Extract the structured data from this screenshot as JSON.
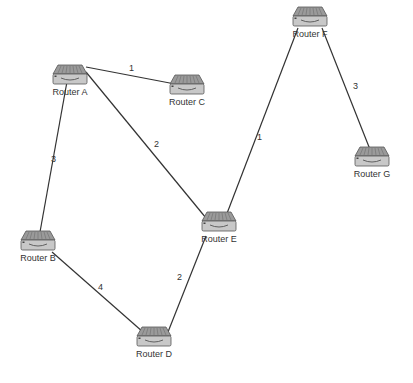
{
  "diagram": {
    "type": "network-topology",
    "colors": {
      "edge": "#333333",
      "label": "#333333",
      "router_body": "#c8c8c8",
      "router_top": "#9a9a9a",
      "router_stroke": "#555555"
    },
    "nodes": [
      {
        "id": "A",
        "label": "Router A",
        "icon": "router-icon",
        "x": 70,
        "y": 78
      },
      {
        "id": "B",
        "label": "Router B",
        "icon": "router-icon",
        "x": 38,
        "y": 244
      },
      {
        "id": "C",
        "label": "Router C",
        "icon": "router-icon",
        "x": 187,
        "y": 88
      },
      {
        "id": "D",
        "label": "Router D",
        "icon": "router-icon",
        "x": 154,
        "y": 340
      },
      {
        "id": "E",
        "label": "Router E",
        "icon": "router-icon",
        "x": 219,
        "y": 225
      },
      {
        "id": "F",
        "label": "Router F",
        "icon": "router-icon",
        "x": 310,
        "y": 20
      },
      {
        "id": "G",
        "label": "Router G",
        "icon": "router-icon",
        "x": 372,
        "y": 160
      }
    ],
    "edges": [
      {
        "from": "A",
        "to": "C",
        "weight": "1",
        "x1": 86,
        "y1": 67,
        "x2": 175,
        "y2": 84,
        "lx": 129,
        "ly": 63
      },
      {
        "from": "A",
        "to": "B",
        "weight": "3",
        "x1": 68,
        "y1": 76,
        "x2": 40,
        "y2": 232,
        "lx": 51,
        "ly": 154
      },
      {
        "from": "A",
        "to": "E",
        "weight": "2",
        "x1": 86,
        "y1": 72,
        "x2": 206,
        "y2": 218,
        "lx": 154,
        "ly": 139
      },
      {
        "from": "B",
        "to": "D",
        "weight": "4",
        "x1": 52,
        "y1": 252,
        "x2": 143,
        "y2": 332,
        "lx": 98,
        "ly": 282
      },
      {
        "from": "E",
        "to": "D",
        "weight": "2",
        "x1": 206,
        "y1": 236,
        "x2": 168,
        "y2": 332,
        "lx": 177,
        "ly": 272
      },
      {
        "from": "E",
        "to": "F",
        "weight": "1",
        "x1": 226,
        "y1": 216,
        "x2": 298,
        "y2": 28,
        "lx": 257,
        "ly": 132
      },
      {
        "from": "F",
        "to": "G",
        "weight": "3",
        "x1": 322,
        "y1": 28,
        "x2": 371,
        "y2": 152,
        "lx": 353,
        "ly": 81
      }
    ]
  }
}
